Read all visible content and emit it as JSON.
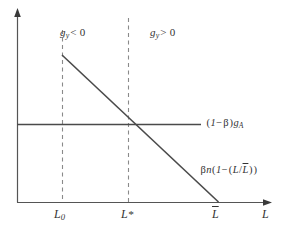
{
  "figure": {
    "type": "economics-phase-diagram",
    "background_color": "#ffffff",
    "line_color": "#444444",
    "dash_color": "#777777",
    "axes": {
      "x_axis_label": "L",
      "y_axis_label": "",
      "x_axis_has_arrow": true,
      "y_axis_has_arrow": true
    },
    "tick_labels": [
      {
        "id": "L0",
        "base": "L",
        "subscript": "0",
        "x_px": 62
      },
      {
        "id": "Lstar",
        "base": "L",
        "superscript": "*",
        "x_px": 128
      },
      {
        "id": "Lbar",
        "base": "L",
        "overbar": true,
        "x_px": 218
      }
    ],
    "region_labels": [
      {
        "id": "left-region",
        "text": "g",
        "subscript": "y",
        "relation": "< 0"
      },
      {
        "id": "right-region",
        "text": "g",
        "subscript": "y",
        "relation": "> 0"
      }
    ],
    "curves": [
      {
        "id": "horizontal-line",
        "kind": "horizontal",
        "label_parts": {
          "open": "(",
          "one": "1",
          "minus": "−",
          "beta": "β",
          "close": ")",
          "g": "g",
          "sub": "A"
        },
        "label_text": "(1−β)g",
        "label_sub": "A",
        "y_px": 124,
        "x_start_px": 17,
        "x_end_px": 200
      },
      {
        "id": "downward-sloping-line",
        "kind": "linear-decreasing",
        "label_text": "βn(1−(L/L))",
        "start": {
          "x_px": 62,
          "y_px": 55
        },
        "end": {
          "x_px": 218,
          "y_px": 202
        }
      }
    ],
    "dashed_verticals": [
      {
        "id": "dash-L0",
        "x_px": 62,
        "y_top_px": 30,
        "y_bottom_px": 202
      },
      {
        "id": "dash-Lstar",
        "x_px": 128,
        "y_top_px": 18,
        "y_bottom_px": 202
      }
    ],
    "curve_label_tokens": {
      "slope_beta": "β",
      "slope_n": "n",
      "slope_open": "(",
      "slope_one": "1",
      "slope_minus": "−",
      "slope_inner_open": "(",
      "slope_L": "L",
      "slope_slash": "/",
      "slope_Lbar": "L",
      "slope_inner_close": ")",
      "slope_close": ")"
    }
  }
}
